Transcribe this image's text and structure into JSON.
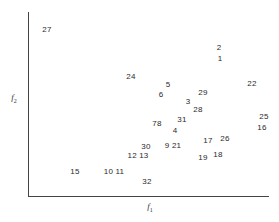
{
  "chart_data": {
    "type": "scatter",
    "title": "",
    "xlabel": "f1",
    "ylabel": "f2",
    "xlabel_main": "f",
    "xlabel_sub": "1",
    "ylabel_main": "f",
    "ylabel_sub": "2",
    "grid": false,
    "legend": null,
    "marker": "text-label-only",
    "points": [
      {
        "label": "27",
        "x": 47,
        "y": 30
      },
      {
        "label": "2",
        "x": 219,
        "y": 48
      },
      {
        "label": "1",
        "x": 220,
        "y": 59
      },
      {
        "label": "24",
        "x": 131,
        "y": 77
      },
      {
        "label": "22",
        "x": 252,
        "y": 84
      },
      {
        "label": "5",
        "x": 168,
        "y": 85
      },
      {
        "label": "29",
        "x": 203,
        "y": 93
      },
      {
        "label": "6",
        "x": 161,
        "y": 95
      },
      {
        "label": "3",
        "x": 188,
        "y": 102
      },
      {
        "label": "28",
        "x": 198,
        "y": 110
      },
      {
        "label": "25",
        "x": 264,
        "y": 117
      },
      {
        "label": "31",
        "x": 182,
        "y": 120
      },
      {
        "label": "78",
        "x": 157,
        "y": 124
      },
      {
        "label": "16",
        "x": 262,
        "y": 128
      },
      {
        "label": "4",
        "x": 175,
        "y": 131
      },
      {
        "label": "26",
        "x": 225,
        "y": 139
      },
      {
        "label": "17",
        "x": 208,
        "y": 141
      },
      {
        "label": "9 21",
        "x": 173,
        "y": 146
      },
      {
        "label": "30",
        "x": 146,
        "y": 147
      },
      {
        "label": "18",
        "x": 218,
        "y": 155
      },
      {
        "label": "12 13",
        "x": 138,
        "y": 156
      },
      {
        "label": "19",
        "x": 203,
        "y": 158
      },
      {
        "label": "15",
        "x": 75,
        "y": 172
      },
      {
        "label": "10 11",
        "x": 114,
        "y": 172
      },
      {
        "label": "32",
        "x": 147,
        "y": 182
      }
    ],
    "note": "Coordinates are pixel positions of the point labels within the 279x222 figure; axes have no tick marks or numeric scale."
  }
}
